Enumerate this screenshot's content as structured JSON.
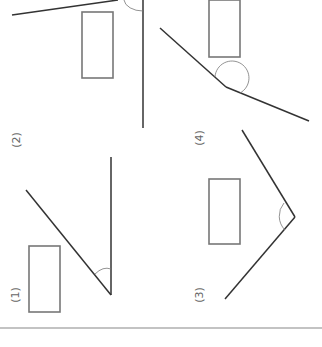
{
  "worksheet": {
    "problems": [
      {
        "label": "(1)",
        "answer": ""
      },
      {
        "label": "(2)",
        "answer": ""
      },
      {
        "label": "(3)",
        "answer": ""
      },
      {
        "label": "(4)",
        "answer": ""
      }
    ]
  },
  "colors": {
    "ray": "#333333",
    "arc": "#777777",
    "box": "#777777",
    "background": "#ffffff"
  }
}
